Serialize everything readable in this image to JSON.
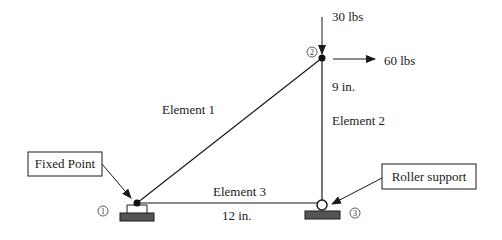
{
  "diagram": {
    "nodes": [
      {
        "id": "1",
        "label": "1",
        "x": 137,
        "y": 203
      },
      {
        "id": "2",
        "label": "2",
        "x": 322,
        "y": 58
      },
      {
        "id": "3",
        "label": "3",
        "x": 322,
        "y": 205
      }
    ],
    "elements": [
      {
        "label": "Element 1",
        "from": "1",
        "to": "2"
      },
      {
        "label": "Element 2",
        "from": "2",
        "to": "3"
      },
      {
        "label": "Element 3",
        "from": "1",
        "to": "3"
      }
    ],
    "dimensions": {
      "vertical": "9 in.",
      "horizontal": "12 in."
    },
    "loads": {
      "vertical": "30 lbs",
      "horizontal": "60 lbs"
    },
    "callouts": {
      "fixed": "Fixed Point",
      "roller": "Roller support"
    },
    "colors": {
      "line": "#1a1a1a",
      "support_fill": "#555555"
    }
  }
}
